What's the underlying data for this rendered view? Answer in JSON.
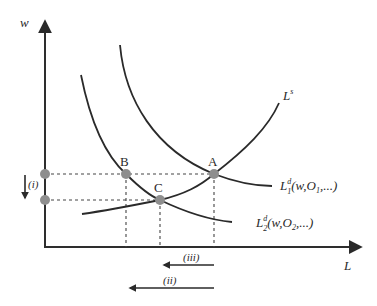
{
  "diagram": {
    "type": "labor-market supply and demand",
    "axes": {
      "y_label": "w",
      "x_label": "L"
    },
    "curves": {
      "supply": {
        "label_main": "L",
        "label_sup": "s"
      },
      "demand1": {
        "label_main": "L",
        "label_sup": "d",
        "label_sub": "1",
        "label_args_pre": "(w,O",
        "label_args_sub": "1",
        "label_args_post": ",...)"
      },
      "demand2": {
        "label_main": "L",
        "label_sup": "d",
        "label_sub": "2",
        "label_args_pre": "(w,O",
        "label_args_sub": "2",
        "label_args_post": ",...)"
      }
    },
    "points": [
      {
        "id": "A",
        "label": "A"
      },
      {
        "id": "B",
        "label": "B"
      },
      {
        "id": "C",
        "label": "C"
      }
    ],
    "annotations": {
      "wage_shift": "(i)",
      "employment_shift_total": "(ii)",
      "employment_shift_partial": "(iii)"
    },
    "colors": {
      "line": "#2a2a2a",
      "point": "#8e8e8e",
      "background": "#ffffff"
    }
  }
}
